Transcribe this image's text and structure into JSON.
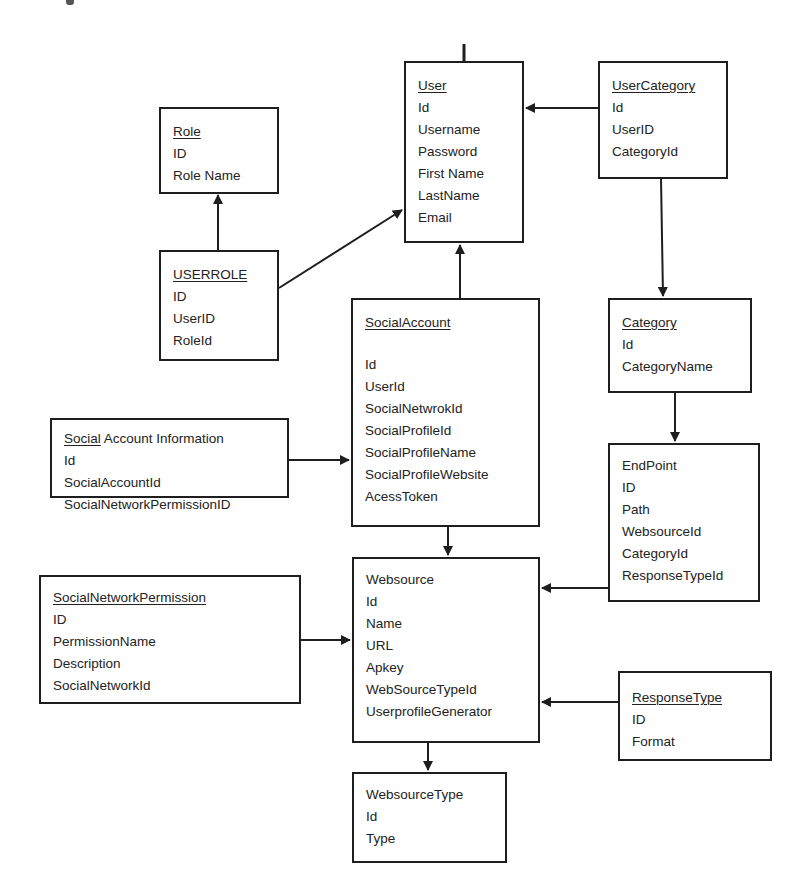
{
  "diagram": {
    "type": "entity-relationship",
    "entities": {
      "user": {
        "title": "User",
        "fields": [
          "Id",
          "Username",
          "Password",
          "First Name",
          "LastName",
          "Email"
        ]
      },
      "user_category": {
        "title": "UserCategory",
        "fields": [
          "Id",
          "UserID",
          "CategoryId"
        ]
      },
      "role": {
        "title": "Role",
        "fields": [
          "ID",
          "Role Name"
        ]
      },
      "userrole": {
        "title": "USERROLE",
        "fields": [
          "ID",
          "UserID",
          "RoleId"
        ]
      },
      "social_account": {
        "title": "SocialAccount",
        "fields": [
          "Id",
          "UserId",
          "SocialNetwrokId",
          "SocialProfileId",
          "SocialProfileName",
          "SocialProfileWebsite",
          "AcessToken"
        ]
      },
      "category": {
        "title": "Category",
        "fields": [
          "Id",
          "CategoryName"
        ]
      },
      "social_account_information": {
        "title_underlined": "Social",
        "title_rest": " Account Information",
        "fields": [
          "Id",
          "SocialAccountId",
          "SocialNetworkPermissionID"
        ]
      },
      "endpoint": {
        "title": "EndPoint",
        "fields": [
          "ID",
          "Path",
          "WebsourceId",
          "CategoryId",
          "ResponseTypeId"
        ]
      },
      "social_network_permission": {
        "title": "SocialNetworkPermission",
        "fields": [
          "ID",
          "PermissionName",
          "Description",
          "SocialNetworkId"
        ]
      },
      "websource": {
        "title": "Websource",
        "fields": [
          "Id",
          "Name",
          "URL",
          "Apkey",
          "WebSourceTypeId",
          "UserprofileGenerator"
        ]
      },
      "response_type": {
        "title": "ResponseType",
        "fields": [
          "ID",
          "Format"
        ]
      },
      "websource_type": {
        "title": "WebsourceType",
        "fields": [
          "Id",
          "Type"
        ]
      }
    },
    "relationships": [
      {
        "from": "UserCategory",
        "to": "User"
      },
      {
        "from": "USERROLE",
        "to": "Role"
      },
      {
        "from": "USERROLE",
        "to": "User"
      },
      {
        "from": "SocialAccount",
        "to": "User"
      },
      {
        "from": "UserCategory",
        "to": "Category"
      },
      {
        "from": "Category",
        "to": "EndPoint"
      },
      {
        "from": "Social Account Information",
        "to": "SocialAccount"
      },
      {
        "from": "SocialAccount",
        "to": "Websource"
      },
      {
        "from": "EndPoint",
        "to": "Websource"
      },
      {
        "from": "SocialNetworkPermission",
        "to": "Websource"
      },
      {
        "from": "ResponseType",
        "to": "Websource"
      },
      {
        "from": "Websource",
        "to": "WebsourceType"
      }
    ],
    "colors": {
      "line": "#1e1e1e",
      "background": "#ffffff",
      "text": "#222222"
    }
  }
}
